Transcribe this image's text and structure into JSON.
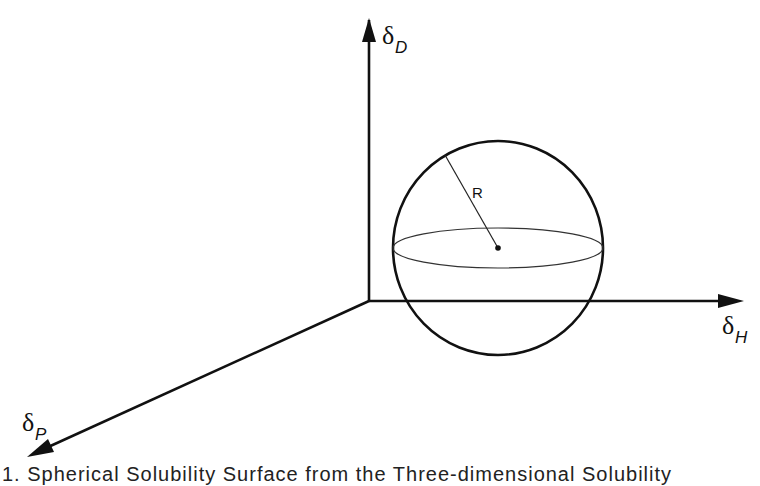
{
  "figure": {
    "axes": {
      "d": {
        "symbol": "δ",
        "subscript": "D"
      },
      "h": {
        "symbol": "δ",
        "subscript": "H"
      },
      "p": {
        "symbol": "δ",
        "subscript": "P"
      }
    },
    "sphere": {
      "radius_label": "R"
    },
    "caption": "1. Spherical Solubility Surface from the Three-dimensional Solubility"
  },
  "colors": {
    "stroke": "#111111",
    "background": "#ffffff"
  }
}
